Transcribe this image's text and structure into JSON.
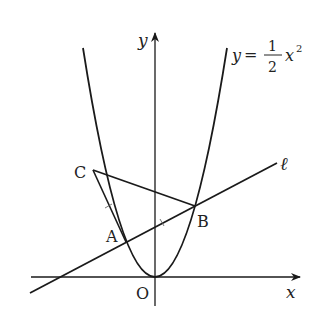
{
  "figure": {
    "type": "coordinate-geometry",
    "axes": {
      "x_label": "x",
      "y_label": "y",
      "origin_label": "O"
    },
    "curve": {
      "equation_lhs": "y",
      "equation_eq": "=",
      "coef_numerator": "1",
      "coef_denominator": "2",
      "var": "x",
      "exponent": "2"
    },
    "line_label": "ℓ",
    "points": {
      "A": "A",
      "B": "B",
      "C": "C"
    },
    "colors": {
      "stroke": "#1a1a1a",
      "text": "#222222",
      "background": "#ffffff"
    }
  }
}
